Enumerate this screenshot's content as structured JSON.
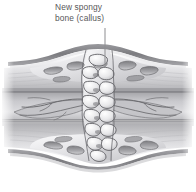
{
  "figure": {
    "background_color": "#ffffff",
    "width": 196,
    "height": 192
  },
  "annotations": {
    "callout": {
      "name": "new-spongy-bone-callus",
      "line1": "New spongy",
      "line2": "bone (callus)",
      "full_text": "New spongy bone (callus)",
      "text_color": "#58585a",
      "leader_line": {
        "x": 105,
        "y_start": 28,
        "y_end": 68,
        "color": "#8d8d90"
      }
    }
  },
  "structures": [
    {
      "name": "periosteum-upper",
      "label": "Periosteum (upper)",
      "color": "#8a8a8d"
    },
    {
      "name": "cortical-bone-upper",
      "label": "Cortical bone (upper)",
      "color": "#b9b9bc"
    },
    {
      "name": "medullary-cavity",
      "label": "Medullary cavity",
      "color": "#cfcfd2"
    },
    {
      "name": "cortical-bone-lower",
      "label": "Cortical bone (lower)",
      "color": "#b9b9bc"
    },
    {
      "name": "periosteum-lower",
      "label": "Periosteum (lower)",
      "color": "#8a8a8d"
    },
    {
      "name": "spongy-bone-callus",
      "label": "New spongy bone (callus)",
      "color": "#d8d8db"
    },
    {
      "name": "fracture-lines",
      "label": "Fracture lines",
      "color": "#6f6f73"
    }
  ],
  "palette": {
    "outline_dark": "#5d5d61",
    "outline_mid": "#7e7e82",
    "bone_light": "#efeff1",
    "bone_mid": "#cdcdd0",
    "bone_shadow": "#a7a7ab",
    "cavity_gray": "#c4c4c8",
    "white": "#ffffff"
  }
}
